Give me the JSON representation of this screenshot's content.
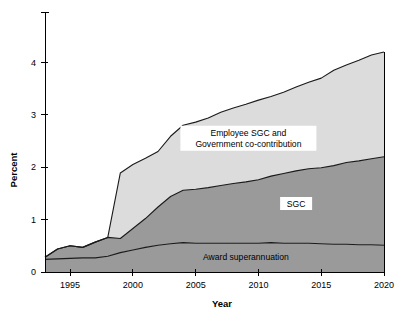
{
  "chart_data": {
    "type": "area",
    "title": "",
    "subtitle": "",
    "xlabel": "Year",
    "ylabel": "Percent",
    "xlim": [
      1993,
      2020
    ],
    "ylim": [
      0,
      4.6
    ],
    "xticks": [
      1995,
      2000,
      2005,
      2010,
      2015,
      2020
    ],
    "xtick_labels": [
      "1995",
      "2000",
      "2005",
      "2010",
      "2015",
      "2020"
    ],
    "yticks": [
      0,
      1,
      2,
      3,
      4
    ],
    "ytick_labels": [
      "0",
      "1",
      "2",
      "3",
      "4"
    ],
    "grid": false,
    "legend_position": "inline-annotations",
    "stacked": true,
    "x": [
      1993,
      1994,
      1995,
      1996,
      1997,
      1998,
      1999,
      2000,
      2001,
      2002,
      2003,
      2004,
      2005,
      2006,
      2007,
      2008,
      2009,
      2010,
      2011,
      2012,
      2013,
      2014,
      2015,
      2016,
      2017,
      2018,
      2019,
      2020
    ],
    "series": [
      {
        "name": "Award superannuation",
        "color": "#9a9a9a",
        "values": [
          0.24,
          0.25,
          0.26,
          0.27,
          0.27,
          0.3,
          0.37,
          0.42,
          0.47,
          0.51,
          0.54,
          0.56,
          0.55,
          0.55,
          0.55,
          0.55,
          0.55,
          0.55,
          0.56,
          0.55,
          0.55,
          0.55,
          0.54,
          0.53,
          0.53,
          0.52,
          0.52,
          0.51
        ]
      },
      {
        "name": "SGC",
        "color": "#9a9a9a",
        "values": [
          0.04,
          0.19,
          0.24,
          0.2,
          0.3,
          0.36,
          0.27,
          0.41,
          0.55,
          0.73,
          0.9,
          1.0,
          1.03,
          1.06,
          1.1,
          1.14,
          1.17,
          1.21,
          1.27,
          1.33,
          1.38,
          1.42,
          1.45,
          1.5,
          1.56,
          1.6,
          1.64,
          1.69
        ]
      },
      {
        "name": "Employee SGC and Government co-contribution",
        "color": "#dcdcdc",
        "values": [
          0.0,
          0.0,
          0.0,
          0.0,
          0.0,
          0.0,
          1.25,
          1.22,
          1.15,
          1.06,
          1.15,
          1.24,
          1.28,
          1.33,
          1.4,
          1.44,
          1.48,
          1.52,
          1.52,
          1.55,
          1.6,
          1.65,
          1.71,
          1.82,
          1.86,
          1.92,
          1.98,
          2.0
        ]
      }
    ],
    "stack_tops": {
      "bottom_band_top": [
        0.24,
        0.25,
        0.26,
        0.27,
        0.27,
        0.3,
        0.37,
        0.42,
        0.47,
        0.51,
        0.54,
        0.56,
        0.55,
        0.55,
        0.55,
        0.55,
        0.55,
        0.55,
        0.56,
        0.55,
        0.55,
        0.55,
        0.54,
        0.53,
        0.53,
        0.52,
        0.52,
        0.51
      ],
      "middle_band_top": [
        0.28,
        0.44,
        0.5,
        0.47,
        0.57,
        0.66,
        0.64,
        0.83,
        1.02,
        1.24,
        1.44,
        1.56,
        1.58,
        1.61,
        1.65,
        1.69,
        1.72,
        1.76,
        1.83,
        1.88,
        1.93,
        1.97,
        1.99,
        2.03,
        2.09,
        2.12,
        2.16,
        2.2
      ],
      "top_band_top": [
        0.28,
        0.44,
        0.5,
        0.47,
        0.57,
        0.66,
        1.89,
        2.05,
        2.17,
        2.3,
        2.59,
        2.8,
        2.86,
        2.94,
        3.05,
        3.13,
        3.2,
        3.28,
        3.35,
        3.43,
        3.53,
        3.62,
        3.7,
        3.85,
        3.95,
        4.04,
        4.14,
        4.2
      ]
    },
    "annotations": [
      {
        "id": "top-band-label",
        "text_lines": [
          "Employee SGC and",
          "Government co-contribution"
        ],
        "x": 2009.2,
        "y": 2.6,
        "boxed": true
      },
      {
        "id": "middle-band-label",
        "text_lines": [
          "SGC"
        ],
        "x": 2013.0,
        "y": 1.25,
        "boxed": true
      },
      {
        "id": "bottom-band-label",
        "text_lines": [
          "Award superannuation"
        ],
        "x": 2009.0,
        "y": 0.22,
        "boxed": false
      }
    ],
    "colors": {
      "top_band": "#dcdcdc",
      "middle_band": "#9a9a9a",
      "bottom_band": "#9a9a9a",
      "outline": "#1a1a1a",
      "axis": "#000000",
      "background": "#ffffff",
      "text": "#000000"
    }
  },
  "axes": {
    "y_title": "Percent",
    "x_title": "Year",
    "y_tick_labels": [
      "0",
      "1",
      "2",
      "3",
      "4"
    ],
    "x_tick_labels": [
      "1995",
      "2000",
      "2005",
      "2010",
      "2015",
      "2020"
    ]
  },
  "labels": {
    "top_band_line1": "Employee SGC and",
    "top_band_line2": "Government co-contribution",
    "middle_band": "SGC",
    "bottom_band": "Award superannuation"
  }
}
